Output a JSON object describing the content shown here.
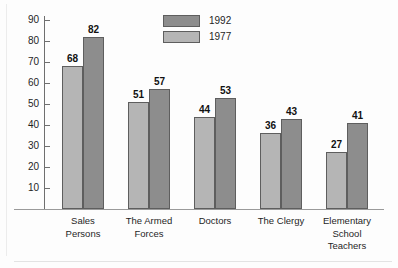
{
  "chart_data": {
    "type": "bar",
    "title": "",
    "xlabel": "",
    "ylabel": "",
    "ylim": [
      0,
      92
    ],
    "y_ticks": [
      10,
      20,
      30,
      40,
      50,
      60,
      70,
      80,
      90
    ],
    "grid": false,
    "legend_position": "top-center",
    "categories": [
      "Sales Persons",
      "The Armed Forces",
      "Doctors",
      "The Clergy",
      "Elementary School Teachers"
    ],
    "category_lines": [
      [
        "Sales",
        "Persons"
      ],
      [
        "The Armed",
        "Forces"
      ],
      [
        "Doctors"
      ],
      [
        "The Clergy"
      ],
      [
        "Elementary",
        "School",
        "Teachers"
      ]
    ],
    "series": [
      {
        "name": "1977",
        "color": "#b5b5b5",
        "values": [
          68,
          51,
          44,
          36,
          27
        ]
      },
      {
        "name": "1992",
        "color": "#8d8d8d",
        "values": [
          82,
          57,
          53,
          43,
          41
        ]
      }
    ]
  },
  "legend": {
    "items": [
      {
        "label": "1992",
        "color": "#8d8d8d"
      },
      {
        "label": "1977",
        "color": "#b5b5b5"
      }
    ]
  }
}
